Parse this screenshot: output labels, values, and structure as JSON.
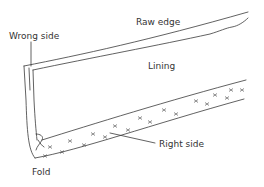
{
  "diagram": {
    "labels": {
      "raw_edge": "Raw edge",
      "wrong_side": "Wrong side",
      "lining": "Lining",
      "right_side": "Right side",
      "fold": "Fold"
    },
    "colors": {
      "line": "#3a3a3a",
      "text": "#333333",
      "background": "#ffffff"
    }
  }
}
